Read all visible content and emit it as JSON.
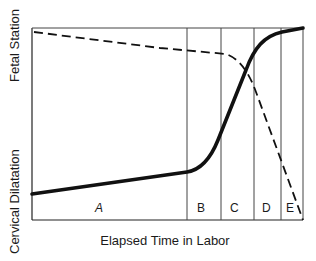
{
  "diagram": {
    "y_axis_labels": {
      "top": "Fetal Station",
      "bottom": "Cervical Dilatation"
    },
    "x_axis_label": "Elapsed Time in Labor",
    "phases": [
      {
        "id": "A",
        "label": "A"
      },
      {
        "id": "B",
        "label": "B"
      },
      {
        "id": "C",
        "label": "C"
      },
      {
        "id": "D",
        "label": "D"
      },
      {
        "id": "E",
        "label": "E"
      }
    ],
    "curves": [
      {
        "name": "Cervical Dilatation",
        "style": "solid-thick"
      },
      {
        "name": "Fetal Station",
        "style": "dashed"
      }
    ],
    "colors": {
      "line": "#111111",
      "background": "#ffffff"
    }
  }
}
